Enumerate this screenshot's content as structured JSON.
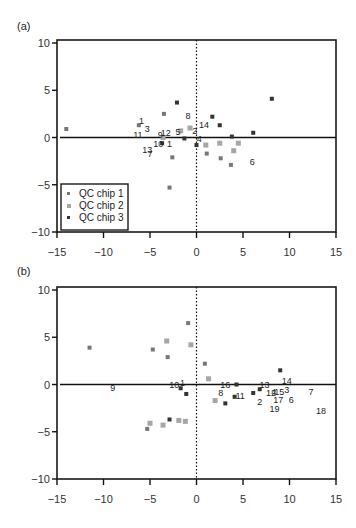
{
  "chart_data": [
    {
      "panel_label": "(a)",
      "type": "scatter",
      "title": "",
      "xlabel": "",
      "ylabel": "",
      "xlim": [
        -15,
        15
      ],
      "ylim": [
        -10,
        10
      ],
      "x_ticks": [
        "-15",
        "-10",
        "-5",
        "0",
        "5",
        "10",
        "15"
      ],
      "y_ticks": [
        "10",
        "5",
        "0",
        "-5",
        "-10"
      ],
      "grid": false,
      "zero_lines": {
        "horizontal": "solid",
        "vertical": "dotted"
      },
      "legend": {
        "position": "lower-left",
        "entries": [
          "QC chip 1",
          "QC chip 2",
          "QC chip 3"
        ]
      },
      "series": [
        {
          "name": "QC chip 1",
          "color": "#777777",
          "size": 4,
          "points": [
            {
              "x": -14.0,
              "y": 0.9
            },
            {
              "x": -6.2,
              "y": 1.3
            },
            {
              "x": -3.5,
              "y": 2.5
            },
            {
              "x": -2.9,
              "y": -5.3
            },
            {
              "x": -2.6,
              "y": -2.1
            },
            {
              "x": 1.1,
              "y": -1.7
            },
            {
              "x": 2.6,
              "y": -2.2
            },
            {
              "x": 3.7,
              "y": -2.9
            }
          ]
        },
        {
          "name": "QC chip 2",
          "color": "#a6a6a6",
          "size": 5,
          "points": [
            {
              "x": -3.6,
              "y": 0.0
            },
            {
              "x": -1.7,
              "y": 0.7
            },
            {
              "x": -0.7,
              "y": 1.0
            },
            {
              "x": 1.0,
              "y": -0.8
            },
            {
              "x": 2.5,
              "y": -0.6
            },
            {
              "x": 4.0,
              "y": -1.4
            },
            {
              "x": 4.5,
              "y": -0.6
            }
          ]
        },
        {
          "name": "QC chip 3",
          "color": "#333333",
          "size": 4,
          "points": [
            {
              "x": -3.7,
              "y": -0.6
            },
            {
              "x": -2.1,
              "y": 3.7
            },
            {
              "x": -1.3,
              "y": -0.1
            },
            {
              "x": 0.0,
              "y": -0.8
            },
            {
              "x": 1.7,
              "y": 2.2
            },
            {
              "x": 2.5,
              "y": 1.3
            },
            {
              "x": 3.8,
              "y": 0.1
            },
            {
              "x": 6.1,
              "y": 0.5
            },
            {
              "x": 8.1,
              "y": 4.1
            }
          ]
        }
      ],
      "annotations": [
        {
          "text": "1",
          "x": -5.9,
          "y": 1.7
        },
        {
          "text": "3",
          "x": -5.3,
          "y": 0.9
        },
        {
          "text": "11",
          "x": -6.3,
          "y": 0.3
        },
        {
          "text": "9",
          "x": -3.9,
          "y": 0.3
        },
        {
          "text": "12",
          "x": -3.3,
          "y": 0.5
        },
        {
          "text": "5",
          "x": -2.0,
          "y": 0.6
        },
        {
          "text": "8",
          "x": -0.9,
          "y": 2.3
        },
        {
          "text": "14",
          "x": 0.8,
          "y": 1.3
        },
        {
          "text": "2",
          "x": -0.2,
          "y": 0.7
        },
        {
          "text": "4",
          "x": 0.3,
          "y": -0.2
        },
        {
          "text": "10",
          "x": -4.1,
          "y": -0.7
        },
        {
          "text": "1",
          "x": -2.9,
          "y": -0.7
        },
        {
          "text": "13",
          "x": -5.3,
          "y": -1.3
        },
        {
          "text": "7",
          "x": -5.0,
          "y": -1.7
        },
        {
          "text": "6",
          "x": 6.0,
          "y": -2.6
        }
      ]
    },
    {
      "panel_label": "(b)",
      "type": "scatter",
      "title": "",
      "xlabel": "",
      "ylabel": "",
      "xlim": [
        -15,
        15
      ],
      "ylim": [
        -10,
        10
      ],
      "x_ticks": [
        "-15",
        "-10",
        "-5",
        "0",
        "5",
        "10",
        "15"
      ],
      "y_ticks": [
        "10",
        "5",
        "0",
        "-5",
        "-10"
      ],
      "grid": false,
      "zero_lines": {
        "horizontal": "solid",
        "vertical": "dotted"
      },
      "series": [
        {
          "name": "QC chip 1",
          "color": "#777777",
          "size": 4,
          "points": [
            {
              "x": -11.5,
              "y": 3.9
            },
            {
              "x": -4.7,
              "y": 3.7
            },
            {
              "x": -3.1,
              "y": 2.9
            },
            {
              "x": -0.9,
              "y": 6.5
            },
            {
              "x": 0.9,
              "y": 2.2
            },
            {
              "x": -5.3,
              "y": -4.7
            }
          ]
        },
        {
          "name": "QC chip 2",
          "color": "#a6a6a6",
          "size": 5,
          "points": [
            {
              "x": -3.2,
              "y": 4.6
            },
            {
              "x": -0.6,
              "y": 4.2
            },
            {
              "x": 1.3,
              "y": 0.6
            },
            {
              "x": 2.0,
              "y": -1.7
            },
            {
              "x": -5.0,
              "y": -4.1
            },
            {
              "x": -3.6,
              "y": -4.3
            },
            {
              "x": -1.9,
              "y": -3.8
            },
            {
              "x": -1.2,
              "y": -3.9
            }
          ]
        },
        {
          "name": "QC chip 3",
          "color": "#333333",
          "size": 4,
          "points": [
            {
              "x": -1.7,
              "y": -0.4
            },
            {
              "x": -1.1,
              "y": -1.0
            },
            {
              "x": -2.9,
              "y": -3.7
            },
            {
              "x": 3.1,
              "y": -2.0
            },
            {
              "x": 4.1,
              "y": -1.3
            },
            {
              "x": 4.3,
              "y": 0.0
            },
            {
              "x": 6.1,
              "y": -0.9
            },
            {
              "x": 6.8,
              "y": -0.5
            },
            {
              "x": 9.0,
              "y": 1.5
            }
          ]
        }
      ],
      "annotations": [
        {
          "text": "9",
          "x": -9.0,
          "y": -0.4
        },
        {
          "text": "10",
          "x": -2.4,
          "y": -0.1
        },
        {
          "text": "1",
          "x": -1.5,
          "y": 0.2
        },
        {
          "text": "16",
          "x": 3.1,
          "y": -0.1
        },
        {
          "text": "8",
          "x": 2.6,
          "y": -0.9
        },
        {
          "text": "11",
          "x": 4.7,
          "y": -1.2
        },
        {
          "text": "13",
          "x": 7.3,
          "y": -0.1
        },
        {
          "text": "12",
          "x": 8.0,
          "y": -0.9
        },
        {
          "text": "4",
          "x": 8.3,
          "y": -0.8
        },
        {
          "text": "15",
          "x": 8.9,
          "y": -0.8
        },
        {
          "text": "3",
          "x": 9.7,
          "y": -0.6
        },
        {
          "text": "14",
          "x": 9.7,
          "y": 0.4
        },
        {
          "text": "7",
          "x": 12.3,
          "y": -0.8
        },
        {
          "text": "2",
          "x": 6.8,
          "y": -1.9
        },
        {
          "text": "17",
          "x": 8.8,
          "y": -1.6
        },
        {
          "text": "6",
          "x": 10.2,
          "y": -1.6
        },
        {
          "text": "19",
          "x": 8.4,
          "y": -2.6
        },
        {
          "text": "18",
          "x": 13.4,
          "y": -2.8
        }
      ]
    }
  ]
}
